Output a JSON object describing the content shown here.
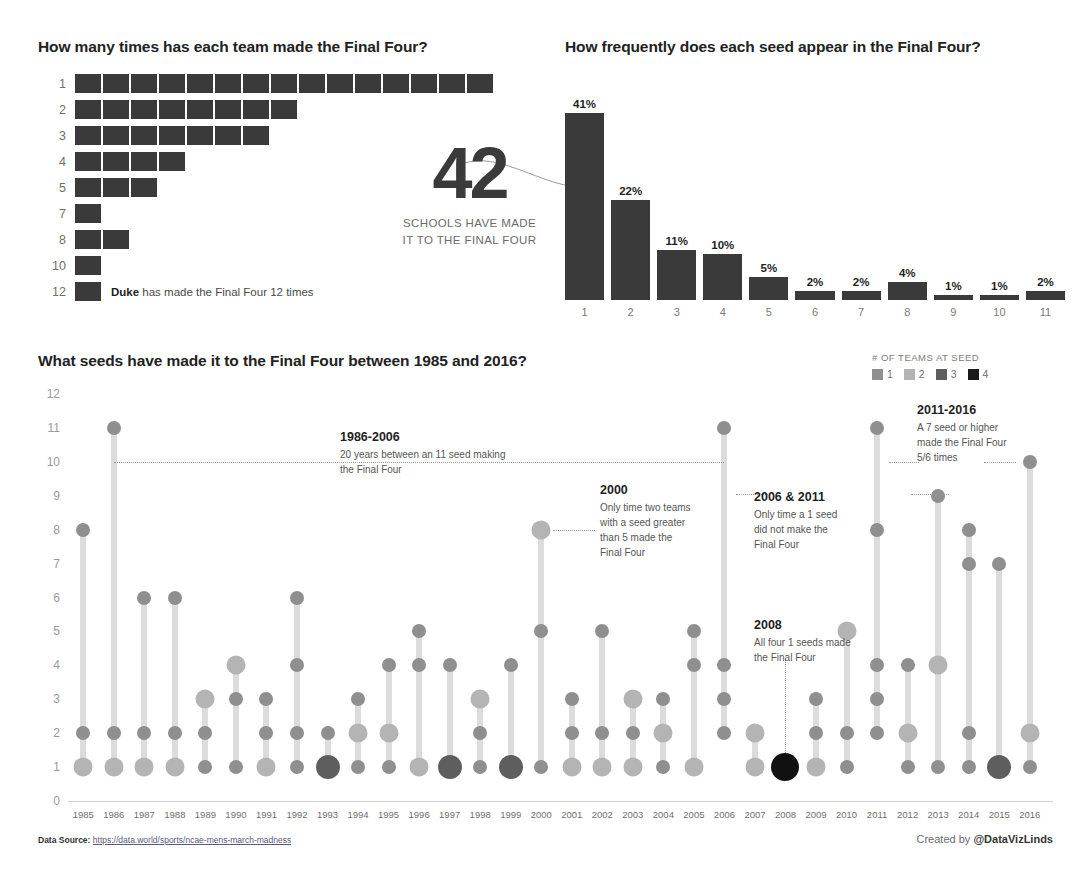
{
  "waffle": {
    "title": "How many times has each team made the Final Four?",
    "rows": [
      {
        "label": "1",
        "count": 15
      },
      {
        "label": "2",
        "count": 8
      },
      {
        "label": "3",
        "count": 7
      },
      {
        "label": "4",
        "count": 4
      },
      {
        "label": "5",
        "count": 3
      },
      {
        "label": "7",
        "count": 1
      },
      {
        "label": "8",
        "count": 2
      },
      {
        "label": "10",
        "count": 1
      },
      {
        "label": "12",
        "count": 1
      }
    ],
    "note_bold": "Duke",
    "note_rest": " has made the Final Four 12 times",
    "square_color": "#3a3a3a"
  },
  "bignum": {
    "value": "42",
    "caption_line1": "SCHOOLS HAVE MADE",
    "caption_line2": "IT TO THE FINAL FOUR"
  },
  "chart_data": [
    {
      "type": "bar",
      "title": "How frequently does each seed appear in the Final Four?",
      "categories": [
        "1",
        "2",
        "3",
        "4",
        "5",
        "6",
        "7",
        "8",
        "9",
        "10",
        "11"
      ],
      "values": [
        41,
        22,
        11,
        10,
        5,
        2,
        2,
        4,
        1,
        1,
        2
      ],
      "value_labels": [
        "41%",
        "22%",
        "11%",
        "10%",
        "5%",
        "2%",
        "2%",
        "4%",
        "1%",
        "1%",
        "2%"
      ],
      "xlabel": "Seed",
      "ylabel": "Percent of Final Four appearances",
      "ylim": [
        0,
        45
      ],
      "grid": false,
      "legend": "none",
      "bar_color": "#3a3a3a"
    },
    {
      "type": "scatter",
      "title": "What seeds have made it to the Final Four between 1985 and 2016?",
      "xlabel": "Year",
      "ylabel": "Seed",
      "ylim": [
        0,
        12
      ],
      "yticks": [
        0,
        1,
        2,
        3,
        4,
        5,
        6,
        7,
        8,
        9,
        10,
        11,
        12
      ],
      "grid": false,
      "legend_title": "# OF TEAMS AT SEED",
      "legend_entries": [
        {
          "label": "1",
          "color": "#8f8f8f"
        },
        {
          "label": "2",
          "color": "#b4b4b4"
        },
        {
          "label": "3",
          "color": "#5e5e5e"
        },
        {
          "label": "4",
          "color": "#1a1a1a"
        }
      ],
      "size_colors": {
        "1": "#8f8f8f",
        "2": "#b4b4b4",
        "3": "#5e5e5e",
        "4": "#111111"
      },
      "size_radius": {
        "1": 7,
        "2": 9.5,
        "3": 12,
        "4": 14
      },
      "years": [
        {
          "year": "1985",
          "points": [
            {
              "seed": 1,
              "teams": 2
            },
            {
              "seed": 2,
              "teams": 1
            },
            {
              "seed": 8,
              "teams": 1
            }
          ]
        },
        {
          "year": "1986",
          "points": [
            {
              "seed": 1,
              "teams": 2
            },
            {
              "seed": 2,
              "teams": 1
            },
            {
              "seed": 11,
              "teams": 1
            }
          ]
        },
        {
          "year": "1987",
          "points": [
            {
              "seed": 1,
              "teams": 2
            },
            {
              "seed": 2,
              "teams": 1
            },
            {
              "seed": 6,
              "teams": 1
            }
          ]
        },
        {
          "year": "1988",
          "points": [
            {
              "seed": 1,
              "teams": 2
            },
            {
              "seed": 2,
              "teams": 1
            },
            {
              "seed": 6,
              "teams": 1
            }
          ]
        },
        {
          "year": "1989",
          "points": [
            {
              "seed": 1,
              "teams": 1
            },
            {
              "seed": 2,
              "teams": 1
            },
            {
              "seed": 3,
              "teams": 2
            }
          ]
        },
        {
          "year": "1990",
          "points": [
            {
              "seed": 1,
              "teams": 1
            },
            {
              "seed": 3,
              "teams": 1
            },
            {
              "seed": 4,
              "teams": 2
            }
          ]
        },
        {
          "year": "1991",
          "points": [
            {
              "seed": 1,
              "teams": 2
            },
            {
              "seed": 2,
              "teams": 1
            },
            {
              "seed": 3,
              "teams": 1
            }
          ]
        },
        {
          "year": "1992",
          "points": [
            {
              "seed": 1,
              "teams": 1
            },
            {
              "seed": 2,
              "teams": 1
            },
            {
              "seed": 4,
              "teams": 1
            },
            {
              "seed": 6,
              "teams": 1
            }
          ]
        },
        {
          "year": "1993",
          "points": [
            {
              "seed": 1,
              "teams": 3
            },
            {
              "seed": 2,
              "teams": 1
            }
          ]
        },
        {
          "year": "1994",
          "points": [
            {
              "seed": 1,
              "teams": 1
            },
            {
              "seed": 2,
              "teams": 2
            },
            {
              "seed": 3,
              "teams": 1
            }
          ]
        },
        {
          "year": "1995",
          "points": [
            {
              "seed": 1,
              "teams": 1
            },
            {
              "seed": 2,
              "teams": 2
            },
            {
              "seed": 4,
              "teams": 1
            }
          ]
        },
        {
          "year": "1996",
          "points": [
            {
              "seed": 1,
              "teams": 2
            },
            {
              "seed": 4,
              "teams": 1
            },
            {
              "seed": 5,
              "teams": 1
            }
          ]
        },
        {
          "year": "1997",
          "points": [
            {
              "seed": 1,
              "teams": 3
            },
            {
              "seed": 4,
              "teams": 1
            }
          ]
        },
        {
          "year": "1998",
          "points": [
            {
              "seed": 1,
              "teams": 1
            },
            {
              "seed": 2,
              "teams": 1
            },
            {
              "seed": 3,
              "teams": 2
            }
          ]
        },
        {
          "year": "1999",
          "points": [
            {
              "seed": 1,
              "teams": 3
            },
            {
              "seed": 4,
              "teams": 1
            }
          ]
        },
        {
          "year": "2000",
          "points": [
            {
              "seed": 1,
              "teams": 1
            },
            {
              "seed": 5,
              "teams": 1
            },
            {
              "seed": 8,
              "teams": 2
            }
          ]
        },
        {
          "year": "2001",
          "points": [
            {
              "seed": 1,
              "teams": 2
            },
            {
              "seed": 2,
              "teams": 1
            },
            {
              "seed": 3,
              "teams": 1
            }
          ]
        },
        {
          "year": "2002",
          "points": [
            {
              "seed": 1,
              "teams": 2
            },
            {
              "seed": 2,
              "teams": 1
            },
            {
              "seed": 5,
              "teams": 1
            }
          ]
        },
        {
          "year": "2003",
          "points": [
            {
              "seed": 1,
              "teams": 2
            },
            {
              "seed": 2,
              "teams": 1
            },
            {
              "seed": 3,
              "teams": 2
            }
          ]
        },
        {
          "year": "2004",
          "points": [
            {
              "seed": 1,
              "teams": 1
            },
            {
              "seed": 2,
              "teams": 2
            },
            {
              "seed": 3,
              "teams": 1
            }
          ]
        },
        {
          "year": "2005",
          "points": [
            {
              "seed": 1,
              "teams": 2
            },
            {
              "seed": 4,
              "teams": 1
            },
            {
              "seed": 5,
              "teams": 1
            }
          ]
        },
        {
          "year": "2006",
          "points": [
            {
              "seed": 2,
              "teams": 1
            },
            {
              "seed": 3,
              "teams": 1
            },
            {
              "seed": 4,
              "teams": 1
            },
            {
              "seed": 11,
              "teams": 1
            }
          ]
        },
        {
          "year": "2007",
          "points": [
            {
              "seed": 1,
              "teams": 2
            },
            {
              "seed": 2,
              "teams": 2
            }
          ]
        },
        {
          "year": "2008",
          "points": [
            {
              "seed": 1,
              "teams": 4
            }
          ]
        },
        {
          "year": "2009",
          "points": [
            {
              "seed": 1,
              "teams": 2
            },
            {
              "seed": 2,
              "teams": 1
            },
            {
              "seed": 3,
              "teams": 1
            }
          ]
        },
        {
          "year": "2010",
          "points": [
            {
              "seed": 1,
              "teams": 1
            },
            {
              "seed": 2,
              "teams": 1
            },
            {
              "seed": 5,
              "teams": 2
            }
          ]
        },
        {
          "year": "2011",
          "points": [
            {
              "seed": 2,
              "teams": 1
            },
            {
              "seed": 3,
              "teams": 1
            },
            {
              "seed": 4,
              "teams": 1
            },
            {
              "seed": 8,
              "teams": 1
            },
            {
              "seed": 11,
              "teams": 1
            }
          ]
        },
        {
          "year": "2012",
          "points": [
            {
              "seed": 1,
              "teams": 1
            },
            {
              "seed": 2,
              "teams": 2
            },
            {
              "seed": 4,
              "teams": 1
            }
          ]
        },
        {
          "year": "2013",
          "points": [
            {
              "seed": 1,
              "teams": 1
            },
            {
              "seed": 4,
              "teams": 2
            },
            {
              "seed": 9,
              "teams": 1
            }
          ]
        },
        {
          "year": "2014",
          "points": [
            {
              "seed": 1,
              "teams": 1
            },
            {
              "seed": 2,
              "teams": 1
            },
            {
              "seed": 7,
              "teams": 1
            },
            {
              "seed": 8,
              "teams": 1
            }
          ]
        },
        {
          "year": "2015",
          "points": [
            {
              "seed": 1,
              "teams": 3
            },
            {
              "seed": 7,
              "teams": 1
            }
          ]
        },
        {
          "year": "2016",
          "points": [
            {
              "seed": 1,
              "teams": 1
            },
            {
              "seed": 2,
              "teams": 2
            },
            {
              "seed": 10,
              "teams": 1
            }
          ]
        }
      ]
    }
  ],
  "annotations": [
    {
      "id": "anno-1986-2006",
      "title": "1986-2006",
      "body": "20 years between an 11 seed making the Final Four",
      "left": 340,
      "top": 430,
      "width": 175
    },
    {
      "id": "anno-2000",
      "title": "2000",
      "body": "Only time two teams with a seed greater than 5 made the Final Four",
      "left": 600,
      "top": 483,
      "width": 92
    },
    {
      "id": "anno-2006-2011",
      "title": "2006 & 2011",
      "body": "Only time a 1 seed did not make the Final Four",
      "left": 754,
      "top": 490,
      "width": 98
    },
    {
      "id": "anno-2008",
      "title": "2008",
      "body": "All four 1 seeds made the Final Four",
      "left": 754,
      "top": 618,
      "width": 98
    },
    {
      "id": "anno-2011-2016",
      "title": "2011-2016",
      "body": "A 7 seed or higher made the Final Four 5/6 times",
      "left": 917,
      "top": 403,
      "width": 92
    }
  ],
  "footer": {
    "source_label": "Data Source:",
    "source_url": "https://data.world/sports/ncae-mens-march-madness",
    "credit_prefix": "Created by ",
    "credit_handle": "@DataVizLinds"
  }
}
